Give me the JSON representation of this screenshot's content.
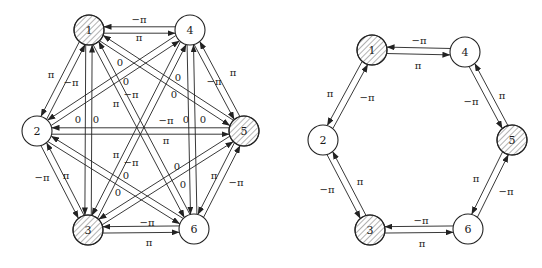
{
  "colors": {
    "stroke": "#222222",
    "node_fill": "#ffffff",
    "hatch": "#555555",
    "background": "#ffffff",
    "text": "#1a1a1a"
  },
  "node_radius": 15,
  "arrow_offset": 3.2,
  "graphs": [
    {
      "id": "full-graph",
      "nodes": [
        {
          "id": "1",
          "label": "1",
          "x": 89,
          "y": 30,
          "hatched": true
        },
        {
          "id": "4",
          "label": "4",
          "x": 190,
          "y": 30,
          "hatched": false
        },
        {
          "id": "2",
          "label": "2",
          "x": 37,
          "y": 131,
          "hatched": false
        },
        {
          "id": "5",
          "label": "5",
          "x": 244,
          "y": 131,
          "hatched": true
        },
        {
          "id": "3",
          "label": "3",
          "x": 88,
          "y": 230,
          "hatched": true
        },
        {
          "id": "6",
          "label": "6",
          "x": 194,
          "y": 229,
          "hatched": false
        }
      ],
      "edges": [
        {
          "from": "4",
          "to": "1",
          "label": "−π",
          "lx": 139,
          "ly": 20
        },
        {
          "from": "1",
          "to": "4",
          "label": "π",
          "lx": 139,
          "ly": 38
        },
        {
          "from": "1",
          "to": "2",
          "label": "π",
          "lx": 51,
          "ly": 75
        },
        {
          "from": "2",
          "to": "1",
          "label": "−π",
          "lx": 71,
          "ly": 83
        },
        {
          "from": "4",
          "to": "5",
          "label": "−π",
          "lx": 214,
          "ly": 82
        },
        {
          "from": "5",
          "to": "4",
          "label": "π",
          "lx": 233,
          "ly": 73
        },
        {
          "from": "2",
          "to": "3",
          "label": "−π",
          "lx": 42,
          "ly": 178
        },
        {
          "from": "3",
          "to": "2",
          "label": "π",
          "lx": 66,
          "ly": 176
        },
        {
          "from": "6",
          "to": "5",
          "label": "−π",
          "lx": 236,
          "ly": 183
        },
        {
          "from": "5",
          "to": "6",
          "label": "π",
          "lx": 214,
          "ly": 176
        },
        {
          "from": "6",
          "to": "3",
          "label": "−π",
          "lx": 147,
          "ly": 223
        },
        {
          "from": "3",
          "to": "6",
          "label": "π",
          "lx": 149,
          "ly": 243
        },
        {
          "from": "1",
          "to": "3",
          "label": "0",
          "lx": 78,
          "ly": 120
        },
        {
          "from": "3",
          "to": "1",
          "label": "0",
          "lx": 96,
          "ly": 120
        },
        {
          "from": "4",
          "to": "6",
          "label": "0",
          "lx": 186,
          "ly": 120
        },
        {
          "from": "6",
          "to": "4",
          "label": "0",
          "lx": 203,
          "ly": 120
        },
        {
          "from": "2",
          "to": "5",
          "label": "−π",
          "lx": 166,
          "ly": 121
        },
        {
          "from": "5",
          "to": "2",
          "label": "π",
          "lx": 166,
          "ly": 141
        },
        {
          "from": "4",
          "to": "2",
          "label": "0",
          "lx": 120,
          "ly": 63
        },
        {
          "from": "2",
          "to": "4",
          "label": "0",
          "lx": 126,
          "ly": 82
        },
        {
          "from": "1",
          "to": "5",
          "label": "0",
          "lx": 178,
          "ly": 78
        },
        {
          "from": "5",
          "to": "1",
          "label": "0",
          "lx": 174,
          "ly": 95
        },
        {
          "from": "1",
          "to": "6",
          "label": "−π",
          "lx": 131,
          "ly": 95
        },
        {
          "from": "6",
          "to": "1",
          "label": "π",
          "lx": 116,
          "ly": 104
        },
        {
          "from": "4",
          "to": "3",
          "label": "π",
          "lx": 116,
          "ly": 155
        },
        {
          "from": "3",
          "to": "4",
          "label": "−π",
          "lx": 131,
          "ly": 163
        },
        {
          "from": "2",
          "to": "6",
          "label": "0",
          "lx": 126,
          "ly": 176
        },
        {
          "from": "6",
          "to": "2",
          "label": "0",
          "lx": 118,
          "ly": 193
        },
        {
          "from": "5",
          "to": "3",
          "label": "0",
          "lx": 177,
          "ly": 167
        },
        {
          "from": "3",
          "to": "5",
          "label": "0",
          "lx": 183,
          "ly": 185
        }
      ]
    },
    {
      "id": "ring-graph",
      "nodes": [
        {
          "id": "1",
          "label": "1",
          "x": 372,
          "y": 50,
          "hatched": true
        },
        {
          "id": "4",
          "label": "4",
          "x": 465,
          "y": 52,
          "hatched": false
        },
        {
          "id": "2",
          "label": "2",
          "x": 323,
          "y": 140,
          "hatched": false
        },
        {
          "id": "5",
          "label": "5",
          "x": 512,
          "y": 140,
          "hatched": true
        },
        {
          "id": "3",
          "label": "3",
          "x": 370,
          "y": 230,
          "hatched": true
        },
        {
          "id": "6",
          "label": "6",
          "x": 468,
          "y": 229,
          "hatched": false
        }
      ],
      "edges": [
        {
          "from": "4",
          "to": "1",
          "label": "−π",
          "lx": 419,
          "ly": 41
        },
        {
          "from": "1",
          "to": "4",
          "label": "π",
          "lx": 418,
          "ly": 66
        },
        {
          "from": "1",
          "to": "2",
          "label": "π",
          "lx": 330,
          "ly": 94
        },
        {
          "from": "2",
          "to": "1",
          "label": "−π",
          "lx": 367,
          "ly": 98
        },
        {
          "from": "4",
          "to": "5",
          "label": "−π",
          "lx": 471,
          "ly": 102
        },
        {
          "from": "5",
          "to": "4",
          "label": "π",
          "lx": 502,
          "ly": 96
        },
        {
          "from": "2",
          "to": "3",
          "label": "−π",
          "lx": 327,
          "ly": 190
        },
        {
          "from": "3",
          "to": "2",
          "label": "π",
          "lx": 360,
          "ly": 182
        },
        {
          "from": "6",
          "to": "5",
          "label": "−π",
          "lx": 506,
          "ly": 192
        },
        {
          "from": "5",
          "to": "6",
          "label": "π",
          "lx": 476,
          "ly": 179
        },
        {
          "from": "6",
          "to": "3",
          "label": "−π",
          "lx": 421,
          "ly": 221
        },
        {
          "from": "3",
          "to": "6",
          "label": "π",
          "lx": 422,
          "ly": 244
        }
      ]
    }
  ]
}
